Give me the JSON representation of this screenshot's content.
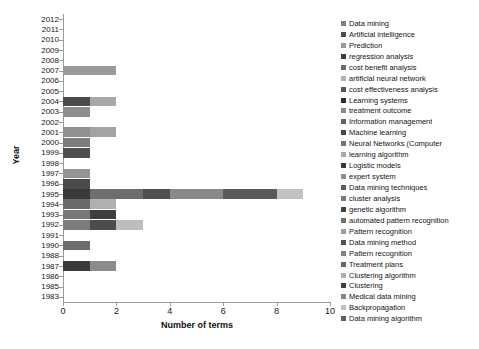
{
  "chart_data": {
    "type": "bar",
    "orientation": "horizontal",
    "stacked": true,
    "title": "",
    "xlabel": "Number of terms",
    "ylabel": "Year",
    "xlim": [
      0,
      10
    ],
    "xticks": [
      0,
      2,
      4,
      6,
      8,
      10
    ],
    "grid": false,
    "legend_position": "right",
    "categories": [
      "2012",
      "2011",
      "2010",
      "2009",
      "2008",
      "2007",
      "2006",
      "2005",
      "2004",
      "2003",
      "2002",
      "2001",
      "2000",
      "1999",
      "1998",
      "1997",
      "1996",
      "1995",
      "1994",
      "1993",
      "1992",
      "1991",
      "1990",
      "1988",
      "1987",
      "1986",
      "1985",
      "1983"
    ],
    "legend": [
      {
        "label": "Data mining",
        "color": "#7f7f7f"
      },
      {
        "label": "Artificial intelligence",
        "color": "#4d4d4d"
      },
      {
        "label": "Prediction",
        "color": "#9a9a9a"
      },
      {
        "label": "regression analysis",
        "color": "#3c3c3c"
      },
      {
        "label": "cost benefit analysis",
        "color": "#6b6b6b"
      },
      {
        "label": "artificial neural network",
        "color": "#b3b3b3"
      },
      {
        "label": "cost effectiveness analysis",
        "color": "#565656"
      },
      {
        "label": "Learning systems",
        "color": "#2f2f2f"
      },
      {
        "label": "treatment outcome",
        "color": "#8a8a8a"
      },
      {
        "label": "Information management",
        "color": "#616161"
      },
      {
        "label": "Machine learning",
        "color": "#454545"
      },
      {
        "label": "Neural Networks (Computer",
        "color": "#747474"
      },
      {
        "label": "learning algorithm",
        "color": "#a6a6a6"
      },
      {
        "label": "Logistic models",
        "color": "#383838"
      },
      {
        "label": "expert system",
        "color": "#909090"
      },
      {
        "label": "Data mining techniques",
        "color": "#5c5c5c"
      },
      {
        "label": "cluster analysis",
        "color": "#7a7a7a"
      },
      {
        "label": "genetic algorithm",
        "color": "#434343"
      },
      {
        "label": "automated pattern recognition",
        "color": "#6f6f6f"
      },
      {
        "label": "Pattern recognition",
        "color": "#9e9e9e"
      },
      {
        "label": "Data mining method",
        "color": "#515151"
      },
      {
        "label": "Pattern recognition",
        "color": "#808080"
      },
      {
        "label": "Treatment plans",
        "color": "#696969"
      },
      {
        "label": "Clustering algorithm",
        "color": "#aeaeae"
      },
      {
        "label": "Clustering",
        "color": "#3f3f3f"
      },
      {
        "label": "Medical data mining",
        "color": "#878787"
      },
      {
        "label": "Backpropagation",
        "color": "#c0c0c0"
      },
      {
        "label": "Data mining algorithm",
        "color": "#5f5f5f"
      }
    ],
    "bars": [
      {
        "year": "2012",
        "total": 0,
        "segments": []
      },
      {
        "year": "2011",
        "total": 0,
        "segments": []
      },
      {
        "year": "2010",
        "total": 0,
        "segments": []
      },
      {
        "year": "2009",
        "total": 0,
        "segments": []
      },
      {
        "year": "2008",
        "total": 0,
        "segments": []
      },
      {
        "year": "2007",
        "total": 2,
        "segments": [
          {
            "series": "Prediction",
            "value": 2,
            "color": "#9a9a9a"
          }
        ]
      },
      {
        "year": "2006",
        "total": 0,
        "segments": []
      },
      {
        "year": "2005",
        "total": 0,
        "segments": []
      },
      {
        "year": "2004",
        "total": 2,
        "segments": [
          {
            "series": "Artificial intelligence",
            "value": 1,
            "color": "#4a4a4a"
          },
          {
            "series": "artificial neural network",
            "value": 1,
            "color": "#a8a8a8"
          }
        ]
      },
      {
        "year": "2003",
        "total": 1,
        "segments": [
          {
            "series": "cost benefit analysis",
            "value": 1,
            "color": "#8e8e8e"
          }
        ]
      },
      {
        "year": "2002",
        "total": 0,
        "segments": []
      },
      {
        "year": "2001",
        "total": 2,
        "segments": [
          {
            "series": "Learning systems",
            "value": 1,
            "color": "#909090"
          },
          {
            "series": "treatment outcome",
            "value": 1,
            "color": "#a3a3a3"
          }
        ]
      },
      {
        "year": "2000",
        "total": 1,
        "segments": [
          {
            "series": "Machine learning",
            "value": 1,
            "color": "#7d7d7d"
          }
        ]
      },
      {
        "year": "1999",
        "total": 1,
        "segments": [
          {
            "series": "Neural Networks (Computer",
            "value": 1,
            "color": "#4f4f4f"
          }
        ]
      },
      {
        "year": "1998",
        "total": 0,
        "segments": []
      },
      {
        "year": "1997",
        "total": 1,
        "segments": [
          {
            "series": "Logistic models",
            "value": 1,
            "color": "#949494"
          }
        ]
      },
      {
        "year": "1996",
        "total": 1,
        "segments": [
          {
            "series": "expert system",
            "value": 1,
            "color": "#4b4b4b"
          }
        ]
      },
      {
        "year": "1995",
        "total": 9,
        "segments": [
          {
            "series": "Data mining",
            "value": 1,
            "color": "#3a3a3a"
          },
          {
            "series": "Data mining techniques",
            "value": 2,
            "color": "#6e6e6e"
          },
          {
            "series": "cluster analysis",
            "value": 1,
            "color": "#4f4f4f"
          },
          {
            "series": "genetic algorithm",
            "value": 2,
            "color": "#8a8a8a"
          },
          {
            "series": "automated pattern recognition",
            "value": 2,
            "color": "#5a5a5a"
          },
          {
            "series": "Backpropagation",
            "value": 1,
            "color": "#c2c2c2"
          }
        ]
      },
      {
        "year": "1994",
        "total": 2,
        "segments": [
          {
            "series": "Pattern recognition",
            "value": 1,
            "color": "#6a6a6a"
          },
          {
            "series": "Clustering algorithm",
            "value": 1,
            "color": "#b0b0b0"
          }
        ]
      },
      {
        "year": "1993",
        "total": 2,
        "segments": [
          {
            "series": "Data mining method",
            "value": 1,
            "color": "#787878"
          },
          {
            "series": "Clustering",
            "value": 1,
            "color": "#3e3e3e"
          }
        ]
      },
      {
        "year": "1992",
        "total": 3,
        "segments": [
          {
            "series": "Medical data mining",
            "value": 1,
            "color": "#7c7c7c"
          },
          {
            "series": "Pattern recognition",
            "value": 1,
            "color": "#4c4c4c"
          },
          {
            "series": "Backpropagation",
            "value": 1,
            "color": "#bdbdbd"
          }
        ]
      },
      {
        "year": "1991",
        "total": 0,
        "segments": []
      },
      {
        "year": "1990",
        "total": 1,
        "segments": [
          {
            "series": "Treatment plans",
            "value": 1,
            "color": "#6d6d6d"
          }
        ]
      },
      {
        "year": "1988",
        "total": 0,
        "segments": []
      },
      {
        "year": "1987",
        "total": 2,
        "segments": [
          {
            "series": "Data mining algorithm",
            "value": 1,
            "color": "#3b3b3b"
          },
          {
            "series": "Clustering algorithm",
            "value": 1,
            "color": "#8b8b8b"
          }
        ]
      },
      {
        "year": "1986",
        "total": 0,
        "segments": []
      },
      {
        "year": "1985",
        "total": 0,
        "segments": []
      },
      {
        "year": "1983",
        "total": 0,
        "segments": []
      }
    ]
  }
}
